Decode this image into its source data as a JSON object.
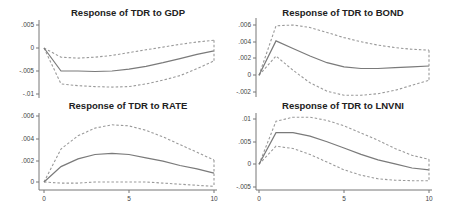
{
  "chart_data": [
    {
      "type": "line",
      "title": "Response of TDR to GDP",
      "xlabel": "",
      "ylabel": "",
      "x": [
        0,
        1,
        2,
        3,
        4,
        5,
        6,
        7,
        8,
        9,
        10
      ],
      "xlim": [
        0,
        10
      ],
      "ylim": [
        -0.01,
        0.005
      ],
      "yticks": [
        0.005,
        0,
        -0.005,
        -0.01
      ],
      "ytick_labels": [
        ".005",
        "0",
        "-.005",
        "-.01"
      ],
      "series": [
        {
          "name": "IRF",
          "style": "solid",
          "values": [
            0,
            -0.005,
            -0.005,
            -0.0051,
            -0.005,
            -0.0046,
            -0.004,
            -0.0032,
            -0.0023,
            -0.0014,
            -0.0006
          ]
        },
        {
          "name": "Upper 95% CI",
          "style": "dashed",
          "values": [
            0,
            -0.002,
            -0.0022,
            -0.002,
            -0.0016,
            -0.001,
            -0.0004,
            0.0002,
            0.0008,
            0.0013,
            0.0017
          ]
        },
        {
          "name": "Lower 95% CI",
          "style": "dashed",
          "values": [
            0,
            -0.0078,
            -0.0082,
            -0.0084,
            -0.0085,
            -0.0084,
            -0.0078,
            -0.007,
            -0.006,
            -0.0045,
            -0.0028
          ]
        }
      ],
      "grid": false,
      "legend": null
    },
    {
      "type": "line",
      "title": "Response of TDR to BOND",
      "xlabel": "",
      "ylabel": "",
      "x": [
        0,
        1,
        2,
        3,
        4,
        5,
        6,
        7,
        8,
        9,
        10
      ],
      "xlim": [
        0,
        10
      ],
      "ylim": [
        -0.002,
        0.006
      ],
      "yticks": [
        0.006,
        0.004,
        0.002,
        0,
        -0.002
      ],
      "ytick_labels": [
        ".006",
        ".004",
        ".002",
        "0",
        "-.002"
      ],
      "series": [
        {
          "name": "IRF",
          "style": "solid",
          "values": [
            0,
            0.0041,
            0.0032,
            0.0023,
            0.0015,
            0.001,
            0.0008,
            0.0008,
            0.0009,
            0.001,
            0.0011
          ]
        },
        {
          "name": "Upper 95% CI",
          "style": "dashed",
          "values": [
            0,
            0.0059,
            0.006,
            0.0057,
            0.0051,
            0.0045,
            0.004,
            0.0036,
            0.0033,
            0.0031,
            0.003
          ]
        },
        {
          "name": "Lower 95% CI",
          "style": "dashed",
          "values": [
            0,
            0.0023,
            0.0006,
            -0.0009,
            -0.0019,
            -0.0024,
            -0.0024,
            -0.0022,
            -0.0018,
            -0.0012,
            -0.0006
          ]
        }
      ],
      "grid": false,
      "legend": null
    },
    {
      "type": "line",
      "title": "Response of TDR to RATE",
      "xlabel": "",
      "ylabel": "",
      "x": [
        0,
        1,
        2,
        3,
        4,
        5,
        6,
        7,
        8,
        9,
        10
      ],
      "xlim": [
        0,
        10
      ],
      "ylim": [
        -0.0005,
        0.0062
      ],
      "yticks": [
        0.006,
        0.004,
        0.002,
        0
      ],
      "ytick_labels": [
        ".006",
        ".004",
        ".002",
        "0"
      ],
      "xticks": [
        0,
        5,
        10
      ],
      "xtick_labels": [
        "0",
        "5",
        "10"
      ],
      "series": [
        {
          "name": "IRF",
          "style": "solid",
          "values": [
            0,
            0.0014,
            0.0021,
            0.0025,
            0.0026,
            0.0025,
            0.0022,
            0.0019,
            0.0015,
            0.0012,
            0.0008
          ]
        },
        {
          "name": "Upper 95% CI",
          "style": "dashed",
          "values": [
            0,
            0.003,
            0.0042,
            0.0049,
            0.0052,
            0.0051,
            0.0047,
            0.0041,
            0.0034,
            0.0027,
            0.002
          ]
        },
        {
          "name": "Lower 95% CI",
          "style": "dashed",
          "values": [
            0,
            -0.0001,
            -0.0001,
            0,
            0,
            0,
            0,
            -0.0001,
            -0.0002,
            -0.0003,
            -0.0004
          ]
        }
      ],
      "grid": false,
      "legend": null
    },
    {
      "type": "line",
      "title": "Response of TDR to LNVNI",
      "xlabel": "",
      "ylabel": "",
      "x": [
        0,
        1,
        2,
        3,
        4,
        5,
        6,
        7,
        8,
        9,
        10
      ],
      "xlim": [
        0,
        10
      ],
      "ylim": [
        -0.0055,
        0.011
      ],
      "yticks": [
        0.01,
        0.005,
        0,
        -0.005
      ],
      "ytick_labels": [
        ".01",
        ".005",
        "0",
        "-.005"
      ],
      "xticks": [
        0,
        5,
        10
      ],
      "xtick_labels": [
        "0",
        "5",
        "10"
      ],
      "series": [
        {
          "name": "IRF",
          "style": "solid",
          "values": [
            0,
            0.007,
            0.007,
            0.0062,
            0.005,
            0.0036,
            0.0022,
            0.001,
            0.0001,
            -0.0008,
            -0.0012
          ]
        },
        {
          "name": "Upper 95% CI",
          "style": "dashed",
          "values": [
            0,
            0.0095,
            0.0104,
            0.0104,
            0.0097,
            0.0085,
            0.0069,
            0.0053,
            0.0035,
            0.002,
            0.0011
          ]
        },
        {
          "name": "Lower 95% CI",
          "style": "dashed",
          "values": [
            0,
            0.004,
            0.0035,
            0.0022,
            0.0005,
            -0.0012,
            -0.0024,
            -0.0032,
            -0.0035,
            -0.0036,
            -0.0036
          ]
        }
      ],
      "grid": false,
      "legend": null
    }
  ],
  "layout": {
    "panels": [
      {
        "x0": 44,
        "x1": 214,
        "axisX": 39,
        "yTop": 20,
        "yBottom": 98,
        "axisYBottom": null,
        "titleX": 128,
        "titleY": 16
      },
      {
        "x0": 259,
        "x1": 429,
        "axisX": 256,
        "yTop": 18,
        "yBottom": 97,
        "axisYBottom": null,
        "titleX": 343,
        "titleY": 16
      },
      {
        "x0": 44,
        "x1": 214,
        "axisX": 39,
        "yTop": 113,
        "yBottom": 190,
        "axisYBottom": 190,
        "titleX": 128,
        "titleY": 109
      },
      {
        "x0": 259,
        "x1": 429,
        "axisX": 256,
        "yTop": 113,
        "yBottom": 190,
        "axisYBottom": 190,
        "titleX": 343,
        "titleY": 109
      }
    ],
    "tickPixels": [
      [
        25,
        48,
        71,
        94
      ],
      [
        25,
        42,
        58,
        75,
        92
      ],
      [
        116,
        139,
        161,
        182
      ],
      [
        119,
        142,
        164,
        187
      ]
    ],
    "colors": {
      "irf": "#7a7a7a",
      "ci": "#9a9a9a",
      "axis": "#777777",
      "text": "#222222"
    }
  }
}
